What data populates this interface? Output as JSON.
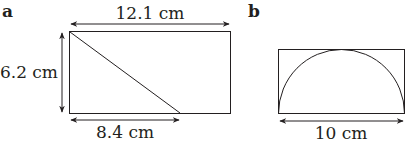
{
  "figure_a": {
    "label": "a",
    "top_dimension": "12.1 cm",
    "left_dimension": "6.2 cm",
    "bottom_dimension": "8.4 cm"
  },
  "figure_b": {
    "label": "b",
    "bottom_dimension": "10 cm"
  },
  "colors": {
    "line": "#231f20",
    "background": "#ffffff"
  }
}
